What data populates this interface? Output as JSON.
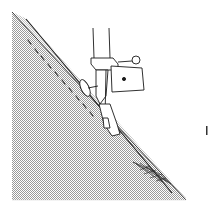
{
  "illustration": {
    "subject": "Sewing machine presser foot stitching along bias-cut fabric edge",
    "colors": {
      "background": "#ffffff",
      "line": "#1a1a1a",
      "fabric_dots": "#9a9a9a"
    },
    "edge_mark": "I"
  }
}
